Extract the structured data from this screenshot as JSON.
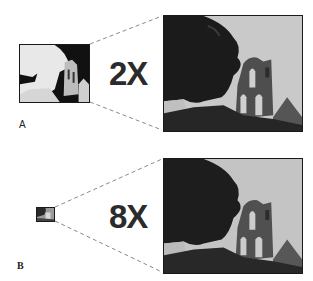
{
  "figure": {
    "panels": [
      {
        "id": "A",
        "label": "A",
        "magnification": "2X",
        "thumbnail": {
          "x": 19,
          "y": 44,
          "w": 70,
          "h": 58,
          "rendering": "high-contrast, washed out"
        },
        "enlarged": {
          "x": 163,
          "y": 15,
          "w": 139,
          "h": 116
        }
      },
      {
        "id": "B",
        "label": "B",
        "magnification": "8X",
        "thumbnail": {
          "x": 36,
          "y": 207,
          "w": 18,
          "h": 14,
          "rendering": "tiny"
        },
        "enlarged": {
          "x": 163,
          "y": 158,
          "w": 139,
          "h": 115
        }
      }
    ],
    "photo_subject": "ruined stone church tower with arched windows beside a dark tree",
    "colors": {
      "frame_border": "#1a1a1a",
      "dashed_line": "#8a8a8a",
      "label_text": "#2b2b2b",
      "sky": "#c8c8c8",
      "foliage": "#1c1c1c",
      "stone": "#5a5a5a"
    }
  }
}
